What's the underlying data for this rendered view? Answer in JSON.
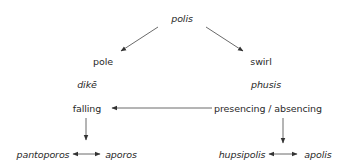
{
  "diagram": {
    "nodes": {
      "polis": "polis",
      "pole": "pole",
      "swirl": "swirl",
      "dike": "dikē",
      "phusis": "phusis",
      "falling": "falling",
      "presencing": "presencing / absencing",
      "pantoporos": "pantoporos",
      "aporos": "aporos",
      "hupsipolis": "hupsipolis",
      "apolis": "apolis"
    },
    "edges": [
      {
        "from": "polis",
        "to": "pole",
        "type": "arrow"
      },
      {
        "from": "polis",
        "to": "swirl",
        "type": "arrow"
      },
      {
        "from": "presencing",
        "to": "falling",
        "type": "arrow"
      },
      {
        "from": "falling",
        "to": "pantoporos/aporos",
        "type": "arrow"
      },
      {
        "from": "presencing",
        "to": "hupsipolis/apolis",
        "type": "arrow"
      },
      {
        "from": "pantoporos",
        "to": "aporos",
        "type": "double-arrow"
      },
      {
        "from": "hupsipolis",
        "to": "apolis",
        "type": "double-arrow"
      }
    ],
    "colors": {
      "text": "#2a2a2a",
      "arrow": "#333333",
      "background": "#ffffff"
    }
  }
}
